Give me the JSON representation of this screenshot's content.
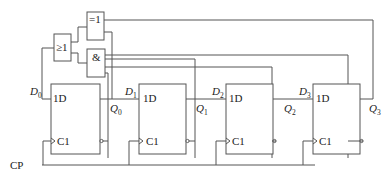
{
  "diagram": {
    "type": "logic-circuit",
    "clock_label": "CP",
    "gates": {
      "or": {
        "label": "≥1"
      },
      "xnor": {
        "label": "=1"
      },
      "and": {
        "label": "&"
      }
    },
    "flipflops": [
      {
        "d_label": "D",
        "d_sub": "0",
        "q_label": "Q",
        "q_sub": "0",
        "data_pin": "1D",
        "clock_pin": "C1"
      },
      {
        "d_label": "D",
        "d_sub": "1",
        "q_label": "Q",
        "q_sub": "1",
        "data_pin": "1D",
        "clock_pin": "C1"
      },
      {
        "d_label": "D",
        "d_sub": "2",
        "q_label": "Q",
        "q_sub": "2",
        "data_pin": "1D",
        "clock_pin": "C1"
      },
      {
        "d_label": "D",
        "d_sub": "3",
        "q_label": "Q",
        "q_sub": "3",
        "data_pin": "1D",
        "clock_pin": "C1"
      }
    ]
  }
}
